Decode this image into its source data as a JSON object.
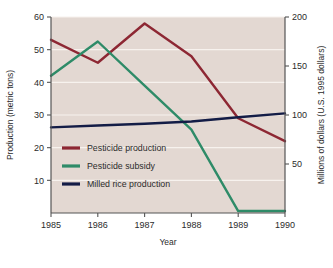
{
  "chart_data": {
    "type": "line",
    "title": "",
    "subtitle": "",
    "xlabel": "Year",
    "ylabel": "Production (metric tons)",
    "y2label": "Millions of dollars (U.S. 1995 dollars)",
    "x": [
      1985,
      1986,
      1987,
      1988,
      1989,
      1990
    ],
    "xticklabels": [
      "1985",
      "1986",
      "1987",
      "1988",
      "1989",
      "1990"
    ],
    "xlim": [
      1985,
      1990
    ],
    "ylim": [
      0,
      60
    ],
    "yticks": [
      10,
      20,
      30,
      40,
      50,
      60
    ],
    "yticklabels": [
      "10",
      "20",
      "30",
      "40",
      "50",
      "60"
    ],
    "y2lim": [
      0,
      200
    ],
    "y2ticks": [
      50,
      100,
      150,
      200
    ],
    "y2ticklabels": [
      "50",
      "100",
      "150",
      "200"
    ],
    "grid": true,
    "grid_color": "#f7f2ee",
    "plot_background": "#e3d8d2",
    "legend_position": "lower left",
    "series": [
      {
        "name": "Pesticide production",
        "axis": "left",
        "color": "#8d2733",
        "values": [
          53,
          46,
          58,
          48,
          29,
          22
        ]
      },
      {
        "name": "Pesticide subsidy",
        "axis": "left",
        "color": "#2e8b68",
        "values": [
          42,
          52.5,
          39,
          25.5,
          0.6,
          0.6
        ]
      },
      {
        "name": "Milled rice production",
        "axis": "left",
        "color": "#131c46",
        "values": [
          26.2,
          26.8,
          27.3,
          28.0,
          29.3,
          30.5
        ]
      }
    ]
  },
  "legend": {
    "items": [
      {
        "label": "Pesticide production",
        "color": "#8d2733"
      },
      {
        "label": "Pesticide subsidy",
        "color": "#2e8b68"
      },
      {
        "label": "Milled rice production",
        "color": "#131c46"
      }
    ]
  },
  "axes": {
    "left_title": "Production (metric tons)",
    "right_title": "Millions of dollars (U.S. 1995 dollars)",
    "bottom_title": "Year"
  }
}
